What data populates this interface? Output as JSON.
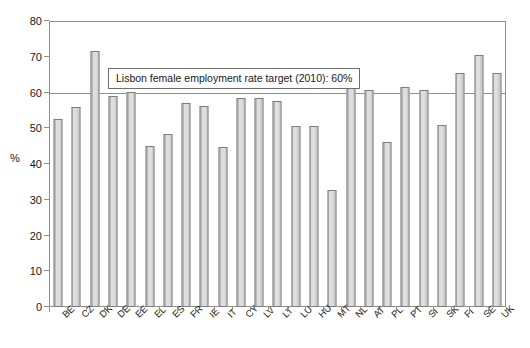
{
  "chart_data": {
    "type": "bar",
    "title": "",
    "subtitle": "",
    "xlabel": "",
    "ylabel": "%",
    "ylim": [
      0,
      80
    ],
    "ytick_step": 10,
    "yticks": [
      0,
      10,
      20,
      30,
      40,
      50,
      60,
      70,
      80
    ],
    "grid": false,
    "gridlines_shown": [
      60,
      80
    ],
    "legend": "none",
    "legend_position": "none",
    "categories": [
      "BE",
      "CZ",
      "DK",
      "DE",
      "EE",
      "EL",
      "ES",
      "FR",
      "IE",
      "IT",
      "CY",
      "LV",
      "LT",
      "LU",
      "HU",
      "MT",
      "NL",
      "AT",
      "PL",
      "PT",
      "SI",
      "SK",
      "FI",
      "SE",
      "UK"
    ],
    "values": [
      52.6,
      56.0,
      71.6,
      59.0,
      60.2,
      45.0,
      48.3,
      57.2,
      56.2,
      44.7,
      58.4,
      58.5,
      57.6,
      50.5,
      50.7,
      32.8,
      65.6,
      60.7,
      46.2,
      61.5,
      60.6,
      50.9,
      65.5,
      70.5,
      65.4
    ],
    "annotations": [
      {
        "text": "Lisbon female employment rate target (2010): 60%",
        "value": 60,
        "type": "reference-line-label"
      }
    ],
    "reference_line": {
      "value": 60,
      "label": "Lisbon female employment rate target (2010): 60%"
    },
    "colors": {
      "bar_fill": "#d6d6d6",
      "bar_border": "#7d7d7d",
      "axis": "#8f8f8f",
      "text": "#1a1a1a",
      "background": "#ffffff"
    }
  }
}
